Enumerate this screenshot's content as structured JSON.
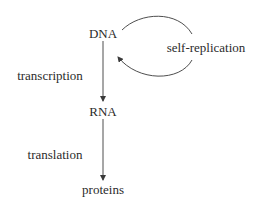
{
  "diagram": {
    "type": "flow",
    "nodes": [
      {
        "id": "dna",
        "label": "DNA"
      },
      {
        "id": "rna",
        "label": "RNA"
      },
      {
        "id": "proteins",
        "label": "proteins"
      }
    ],
    "edges": [
      {
        "from": "dna",
        "to": "rna",
        "label": "transcription"
      },
      {
        "from": "rna",
        "to": "proteins",
        "label": "translation"
      },
      {
        "from": "dna",
        "to": "dna",
        "label": "self-replication"
      }
    ],
    "colors": {
      "line": "#3a3a3a",
      "text": "#2b2b2b",
      "background": "#ffffff"
    }
  }
}
